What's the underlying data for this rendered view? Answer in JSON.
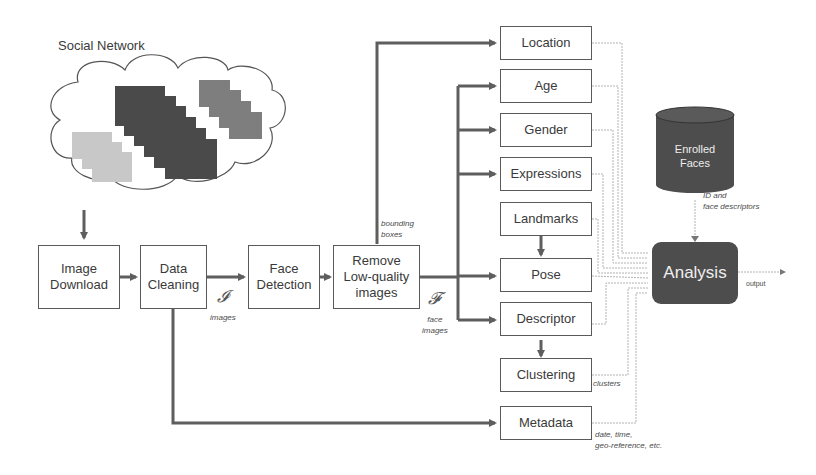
{
  "source": {
    "title": "Social Network"
  },
  "pipeline": [
    {
      "id": "image-download",
      "label": "Image\nDownload"
    },
    {
      "id": "data-cleaning",
      "label": "Data\nCleaning"
    },
    {
      "id": "face-detection",
      "label": "Face\nDetection"
    },
    {
      "id": "remove-low-quality",
      "label": "Remove\nLow-quality\nimages"
    }
  ],
  "modules": [
    {
      "id": "location",
      "label": "Location"
    },
    {
      "id": "age",
      "label": "Age"
    },
    {
      "id": "gender",
      "label": "Gender"
    },
    {
      "id": "expressions",
      "label": "Expressions"
    },
    {
      "id": "landmarks",
      "label": "Landmarks"
    },
    {
      "id": "pose",
      "label": "Pose"
    },
    {
      "id": "descriptor",
      "label": "Descriptor"
    },
    {
      "id": "clustering",
      "label": "Clustering"
    },
    {
      "id": "metadata",
      "label": "Metadata"
    }
  ],
  "database": {
    "label": "Enrolled\nFaces"
  },
  "analysis": {
    "label": "Analysis"
  },
  "annotations": {
    "images_symbol": "𝓘",
    "images_label": "images",
    "faces_symbol": "𝓕",
    "faces_label": "face\nimages",
    "bounding_boxes": "bounding\nboxes",
    "id_descriptors": "ID and\nface descriptors",
    "output": "output",
    "clusters": "clusters",
    "metadata_note": "date, time,\ngeo-reference, etc."
  },
  "colors": {
    "wire": "#5e5e5e",
    "thin_wire": "#9a9a9a",
    "dark_fill": "#4d4d4d"
  }
}
